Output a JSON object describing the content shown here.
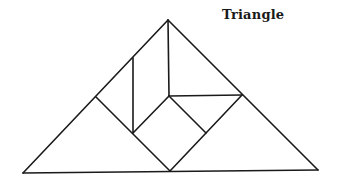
{
  "title": "Triangle",
  "figure": {
    "stroke_color": "#1a1a1a",
    "pieces": [
      {
        "name": "large-triangle-left",
        "points": [
          [
            23,
            173
          ],
          [
            96,
            97
          ],
          [
            170,
            171
          ]
        ]
      },
      {
        "name": "large-triangle-right",
        "points": [
          [
            170,
            171
          ],
          [
            242,
            95
          ],
          [
            318,
            170
          ]
        ]
      },
      {
        "name": "parallelogram",
        "points": [
          [
            96,
            97
          ],
          [
            133,
            58
          ],
          [
            133,
            133
          ]
        ]
      },
      {
        "name": "medium-triangle-top",
        "points": [
          [
            168,
            20
          ],
          [
            169,
            96
          ],
          [
            242,
            95
          ]
        ]
      },
      {
        "name": "square",
        "points": [
          [
            169,
            96
          ],
          [
            206,
            133
          ],
          [
            170,
            171
          ],
          [
            133,
            133
          ]
        ]
      },
      {
        "name": "small-triangle",
        "points": [
          [
            169,
            96
          ],
          [
            242,
            95
          ],
          [
            206,
            133
          ]
        ]
      }
    ],
    "segments": [
      [
        [
          168,
          20
        ],
        [
          23,
          173
        ]
      ],
      [
        [
          168,
          20
        ],
        [
          318,
          170
        ]
      ],
      [
        [
          23,
          173
        ],
        [
          318,
          170
        ]
      ],
      [
        [
          96,
          97
        ],
        [
          170,
          171
        ]
      ],
      [
        [
          133,
          58
        ],
        [
          133,
          133
        ]
      ],
      [
        [
          168,
          20
        ],
        [
          169,
          96
        ]
      ],
      [
        [
          169,
          96
        ],
        [
          242,
          95
        ]
      ],
      [
        [
          242,
          95
        ],
        [
          170,
          171
        ]
      ],
      [
        [
          169,
          96
        ],
        [
          206,
          133
        ]
      ],
      [
        [
          169,
          96
        ],
        [
          133,
          133
        ]
      ]
    ]
  }
}
